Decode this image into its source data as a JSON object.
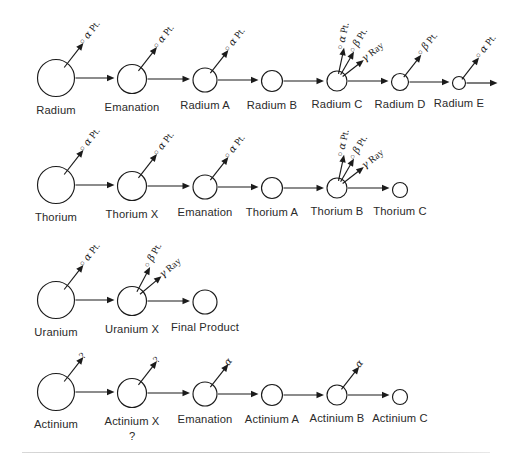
{
  "diagram": {
    "ray_alpha": "α Pt.",
    "ray_beta": "β Pt.",
    "ray_gamma": "γ Ray",
    "ray_alpha_short": "α",
    "ray_unknown": "?",
    "bullet": "○"
  },
  "series": [
    {
      "name": "radium",
      "top": 18,
      "nodes": [
        {
          "label": "Radium",
          "cx": 56,
          "cy": 78,
          "r": 18.5,
          "rays": [
            "alpha"
          ],
          "terminal": false
        },
        {
          "label": "Emanation",
          "cx": 132,
          "cy": 79,
          "r": 14.5,
          "rays": [
            "alpha"
          ],
          "terminal": false
        },
        {
          "label": "Radium A",
          "cx": 205,
          "cy": 80,
          "r": 12.0,
          "rays": [
            "alpha"
          ],
          "terminal": false
        },
        {
          "label": "Radium B",
          "cx": 272,
          "cy": 81,
          "r": 10.5,
          "rays": [],
          "terminal": false
        },
        {
          "label": "Radium C",
          "cx": 337,
          "cy": 81,
          "r": 10.0,
          "rays": [
            "alpha",
            "beta",
            "gamma"
          ],
          "terminal": false
        },
        {
          "label": "Radium D",
          "cx": 400,
          "cy": 82,
          "r": 8.5,
          "rays": [
            "beta"
          ],
          "terminal": false
        },
        {
          "label": "Radium E",
          "cx": 459,
          "cy": 83,
          "r": 6.5,
          "rays": [
            "alpha"
          ],
          "terminal": false
        }
      ]
    },
    {
      "name": "thorium",
      "top": 130,
      "nodes": [
        {
          "label": "Thorium",
          "cx": 56,
          "cy": 185,
          "r": 18.5,
          "rays": [
            "alpha"
          ],
          "terminal": false
        },
        {
          "label": "Thorium X",
          "cx": 132,
          "cy": 186,
          "r": 14.5,
          "rays": [
            "alpha"
          ],
          "terminal": false
        },
        {
          "label": "Emanation",
          "cx": 205,
          "cy": 187,
          "r": 12.0,
          "rays": [
            "alpha"
          ],
          "terminal": false
        },
        {
          "label": "Thorium A",
          "cx": 272,
          "cy": 188,
          "r": 10.5,
          "rays": [],
          "terminal": false
        },
        {
          "label": "Thorium B",
          "cx": 337,
          "cy": 188,
          "r": 10.0,
          "rays": [
            "alpha",
            "beta",
            "gamma"
          ],
          "terminal": false
        },
        {
          "label": "Thorium C",
          "cx": 400,
          "cy": 190,
          "r": 7.5,
          "rays": [],
          "terminal": true
        }
      ]
    },
    {
      "name": "uranium",
      "top": 248,
      "nodes": [
        {
          "label": "Uranium",
          "cx": 56,
          "cy": 300,
          "r": 18.5,
          "rays": [
            "alpha"
          ],
          "terminal": false
        },
        {
          "label": "Uranium X",
          "cx": 132,
          "cy": 301,
          "r": 14.5,
          "rays": [
            "beta",
            "gamma"
          ],
          "terminal": false
        },
        {
          "label": "Final Product",
          "cx": 205,
          "cy": 302,
          "r": 12.0,
          "rays": [],
          "terminal": true
        }
      ]
    },
    {
      "name": "actinium",
      "top": 348,
      "nodes": [
        {
          "label": "Actinium",
          "cx": 56,
          "cy": 392,
          "r": 18.5,
          "rays": [
            "unknown"
          ],
          "terminal": false
        },
        {
          "label": "Actinium X",
          "cx": 132,
          "cy": 393,
          "r": 14.5,
          "rays": [
            "unknown"
          ],
          "terminal": false,
          "sublabel": "?"
        },
        {
          "label": "Emanation",
          "cx": 205,
          "cy": 394,
          "r": 12.0,
          "rays": [
            "alpha_short"
          ],
          "terminal": false
        },
        {
          "label": "Actinium A",
          "cx": 272,
          "cy": 395,
          "r": 10.5,
          "rays": [],
          "terminal": false
        },
        {
          "label": "Actinium B",
          "cx": 337,
          "cy": 395,
          "r": 10.0,
          "rays": [
            "alpha_short"
          ],
          "terminal": false
        },
        {
          "label": "Actinium C",
          "cx": 400,
          "cy": 397,
          "r": 7.5,
          "rays": [],
          "terminal": true
        }
      ]
    }
  ]
}
